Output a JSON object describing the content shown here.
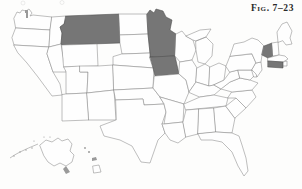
{
  "figure": {
    "caption": "Fig. 7–23",
    "type": "choropleth-outline-map",
    "region": "United States of America",
    "background_color": "#fdfdfc",
    "border_color": "#8a8a8a",
    "shaded_color": "#767676",
    "unshaded_color": "#fefefe"
  },
  "legend": {
    "shaded_meaning": "highlighted states",
    "unshaded_meaning": "other states"
  },
  "map_data": {
    "type": "map",
    "projection": "albers-usa",
    "includes_insets": [
      "Alaska",
      "Hawaii"
    ],
    "shaded_states": [
      "Montana",
      "Minnesota",
      "Iowa",
      "Vermont",
      "Connecticut"
    ],
    "shaded_count": 5,
    "unshaded_states": [
      "Washington",
      "Oregon",
      "California",
      "Idaho",
      "Nevada",
      "Utah",
      "Arizona",
      "Wyoming",
      "Colorado",
      "New Mexico",
      "North Dakota",
      "South Dakota",
      "Nebraska",
      "Kansas",
      "Oklahoma",
      "Texas",
      "Missouri",
      "Arkansas",
      "Louisiana",
      "Wisconsin",
      "Illinois",
      "Michigan",
      "Indiana",
      "Ohio",
      "Kentucky",
      "Tennessee",
      "Mississippi",
      "Alabama",
      "Georgia",
      "Florida",
      "South Carolina",
      "North Carolina",
      "Virginia",
      "West Virginia",
      "Maryland",
      "Delaware",
      "Pennsylvania",
      "New Jersey",
      "New York",
      "Maine",
      "New Hampshire",
      "Massachusetts",
      "Rhode Island",
      "Alaska",
      "Hawaii"
    ],
    "unshaded_count": 45,
    "total_states": 50
  },
  "states": [
    {
      "name": "Washington",
      "abbr": "WA",
      "shaded": false
    },
    {
      "name": "Oregon",
      "abbr": "OR",
      "shaded": false
    },
    {
      "name": "California",
      "abbr": "CA",
      "shaded": false
    },
    {
      "name": "Idaho",
      "abbr": "ID",
      "shaded": false
    },
    {
      "name": "Nevada",
      "abbr": "NV",
      "shaded": false
    },
    {
      "name": "Montana",
      "abbr": "MT",
      "shaded": true
    },
    {
      "name": "Wyoming",
      "abbr": "WY",
      "shaded": false
    },
    {
      "name": "Utah",
      "abbr": "UT",
      "shaded": false
    },
    {
      "name": "Arizona",
      "abbr": "AZ",
      "shaded": false
    },
    {
      "name": "Colorado",
      "abbr": "CO",
      "shaded": false
    },
    {
      "name": "New Mexico",
      "abbr": "NM",
      "shaded": false
    },
    {
      "name": "North Dakota",
      "abbr": "ND",
      "shaded": false
    },
    {
      "name": "South Dakota",
      "abbr": "SD",
      "shaded": false
    },
    {
      "name": "Nebraska",
      "abbr": "NE",
      "shaded": false
    },
    {
      "name": "Kansas",
      "abbr": "KS",
      "shaded": false
    },
    {
      "name": "Oklahoma",
      "abbr": "OK",
      "shaded": false
    },
    {
      "name": "Texas",
      "abbr": "TX",
      "shaded": false
    },
    {
      "name": "Minnesota",
      "abbr": "MN",
      "shaded": true
    },
    {
      "name": "Iowa",
      "abbr": "IA",
      "shaded": true
    },
    {
      "name": "Missouri",
      "abbr": "MO",
      "shaded": false
    },
    {
      "name": "Arkansas",
      "abbr": "AR",
      "shaded": false
    },
    {
      "name": "Louisiana",
      "abbr": "LA",
      "shaded": false
    },
    {
      "name": "Wisconsin",
      "abbr": "WI",
      "shaded": false
    },
    {
      "name": "Illinois",
      "abbr": "IL",
      "shaded": false
    },
    {
      "name": "Michigan",
      "abbr": "MI",
      "shaded": false
    },
    {
      "name": "Indiana",
      "abbr": "IN",
      "shaded": false
    },
    {
      "name": "Ohio",
      "abbr": "OH",
      "shaded": false
    },
    {
      "name": "Kentucky",
      "abbr": "KY",
      "shaded": false
    },
    {
      "name": "Tennessee",
      "abbr": "TN",
      "shaded": false
    },
    {
      "name": "Mississippi",
      "abbr": "MS",
      "shaded": false
    },
    {
      "name": "Alabama",
      "abbr": "AL",
      "shaded": false
    },
    {
      "name": "Georgia",
      "abbr": "GA",
      "shaded": false
    },
    {
      "name": "Florida",
      "abbr": "FL",
      "shaded": false
    },
    {
      "name": "South Carolina",
      "abbr": "SC",
      "shaded": false
    },
    {
      "name": "North Carolina",
      "abbr": "NC",
      "shaded": false
    },
    {
      "name": "Virginia",
      "abbr": "VA",
      "shaded": false
    },
    {
      "name": "West Virginia",
      "abbr": "WV",
      "shaded": false
    },
    {
      "name": "Maryland",
      "abbr": "MD",
      "shaded": false
    },
    {
      "name": "Delaware",
      "abbr": "DE",
      "shaded": false
    },
    {
      "name": "Pennsylvania",
      "abbr": "PA",
      "shaded": false
    },
    {
      "name": "New Jersey",
      "abbr": "NJ",
      "shaded": false
    },
    {
      "name": "New York",
      "abbr": "NY",
      "shaded": false
    },
    {
      "name": "Vermont",
      "abbr": "VT",
      "shaded": true
    },
    {
      "name": "New Hampshire",
      "abbr": "NH",
      "shaded": false
    },
    {
      "name": "Maine",
      "abbr": "ME",
      "shaded": false
    },
    {
      "name": "Massachusetts",
      "abbr": "MA",
      "shaded": false
    },
    {
      "name": "Rhode Island",
      "abbr": "RI",
      "shaded": false
    },
    {
      "name": "Connecticut",
      "abbr": "CT",
      "shaded": true
    },
    {
      "name": "Alaska",
      "abbr": "AK",
      "shaded": false
    },
    {
      "name": "Hawaii",
      "abbr": "HI",
      "shaded": false
    }
  ]
}
